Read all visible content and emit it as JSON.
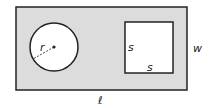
{
  "diagram": {
    "colors": {
      "region_fill": "#dcdcdc",
      "shape_fill": "#ffffff",
      "stroke": "#222222"
    },
    "labels": {
      "radius": "r",
      "square_side_left": "s",
      "square_side_bottom": "s",
      "width": "w",
      "length": "ℓ"
    }
  }
}
